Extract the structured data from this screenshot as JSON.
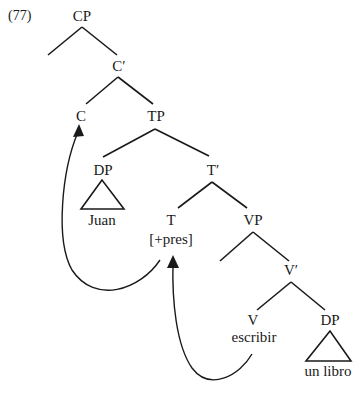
{
  "example_number": "(77)",
  "nodes": {
    "cp": "CP",
    "c_bar": "C′",
    "c": "C",
    "tp": "TP",
    "dp_subject": "DP",
    "subject_text": "Juan",
    "t_bar": "T′",
    "t": "T",
    "t_feature": "[+pres]",
    "vp": "VP",
    "v_bar": "V′",
    "v": "V",
    "verb_text": "escribir",
    "dp_object": "DP",
    "object_text": "un libro"
  },
  "movements": [
    {
      "from": "T",
      "to": "C",
      "label": "T-to-C movement"
    },
    {
      "from": "V",
      "to": "T",
      "label": "V-to-T movement"
    }
  ]
}
